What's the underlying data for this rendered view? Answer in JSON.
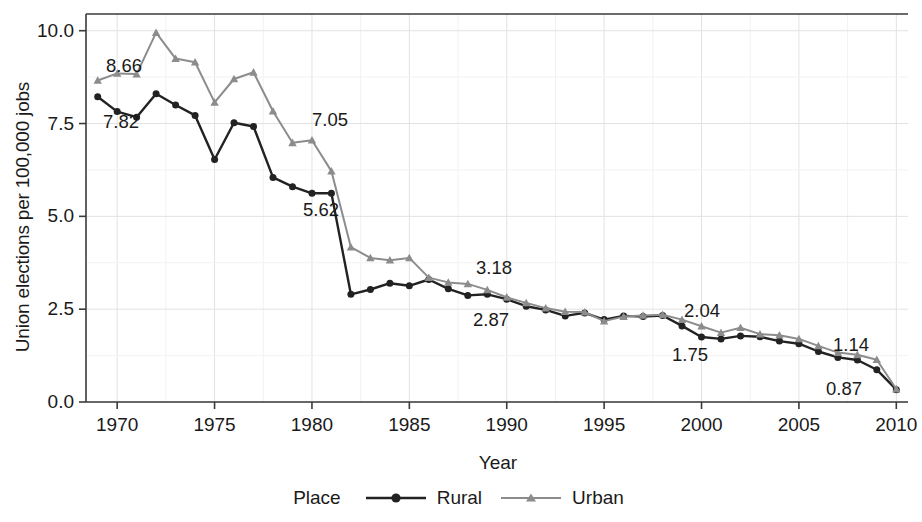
{
  "chart_data": {
    "type": "line",
    "title": "",
    "xlabel": "Year",
    "ylabel": "Union elections per 100,000 jobs",
    "xlim": [
      1968.4,
      2010.6
    ],
    "ylim": [
      0.0,
      10.45
    ],
    "xticks": [
      1970,
      1975,
      1980,
      1985,
      1990,
      1995,
      2000,
      2005,
      2010
    ],
    "yticks": [
      "0.0",
      "2.5",
      "5.0",
      "7.5",
      "10.0"
    ],
    "grid": true,
    "legend_position": "bottom",
    "legend_title": "Place",
    "x": [
      1969,
      1970,
      1971,
      1972,
      1973,
      1974,
      1975,
      1976,
      1977,
      1978,
      1979,
      1980,
      1981,
      1982,
      1983,
      1984,
      1985,
      1986,
      1987,
      1988,
      1989,
      1990,
      1991,
      1992,
      1993,
      1994,
      1995,
      1996,
      1997,
      1998,
      1999,
      2000,
      2001,
      2002,
      2003,
      2004,
      2005,
      2006,
      2007,
      2008,
      2009,
      2010
    ],
    "series": [
      {
        "name": "Rural",
        "color": "#222222",
        "marker": "circle",
        "values": [
          8.22,
          7.82,
          7.67,
          8.3,
          8.0,
          7.72,
          6.53,
          7.52,
          7.42,
          6.05,
          5.8,
          5.62,
          5.62,
          2.9,
          3.03,
          3.2,
          3.13,
          3.3,
          3.05,
          2.87,
          2.9,
          2.77,
          2.58,
          2.48,
          2.32,
          2.4,
          2.22,
          2.32,
          2.3,
          2.33,
          2.05,
          1.75,
          1.7,
          1.78,
          1.76,
          1.64,
          1.57,
          1.36,
          1.2,
          1.13,
          0.87,
          0.33
        ]
      },
      {
        "name": "Urban",
        "color": "#8c8c8c",
        "marker": "triangle",
        "values": [
          8.66,
          8.85,
          8.83,
          9.95,
          9.25,
          9.15,
          8.07,
          8.7,
          8.88,
          7.83,
          6.98,
          7.05,
          6.22,
          4.17,
          3.88,
          3.82,
          3.88,
          3.35,
          3.22,
          3.18,
          3.02,
          2.82,
          2.67,
          2.53,
          2.43,
          2.42,
          2.18,
          2.3,
          2.33,
          2.35,
          2.22,
          2.04,
          1.87,
          2.0,
          1.83,
          1.8,
          1.7,
          1.51,
          1.33,
          1.27,
          1.14,
          0.35
        ]
      }
    ],
    "point_labels": [
      {
        "text": "8.66",
        "series": "Urban",
        "year": 1969,
        "value": 8.66,
        "px": 124,
        "py": 66
      },
      {
        "text": "7.82",
        "series": "Rural",
        "year": 1970,
        "value": 7.82,
        "px": 121,
        "py": 122
      },
      {
        "text": "7.05",
        "series": "Urban",
        "year": 1980,
        "value": 7.05,
        "px": 330,
        "py": 120
      },
      {
        "text": "5.62",
        "series": "Rural",
        "year": 1980,
        "value": 5.62,
        "px": 321,
        "py": 210
      },
      {
        "text": "3.18",
        "series": "Urban",
        "year": 1988,
        "value": 3.18,
        "px": 494,
        "py": 268
      },
      {
        "text": "2.87",
        "series": "Rural",
        "year": 1988,
        "value": 2.87,
        "px": 491,
        "py": 320
      },
      {
        "text": "2.04",
        "series": "Urban",
        "year": 2000,
        "value": 2.04,
        "px": 702,
        "py": 311
      },
      {
        "text": "1.75",
        "series": "Rural",
        "year": 2000,
        "value": 1.75,
        "px": 690,
        "py": 355
      },
      {
        "text": "1.14",
        "series": "Urban",
        "year": 2009,
        "value": 1.14,
        "px": 851,
        "py": 345
      },
      {
        "text": "0.87",
        "series": "Rural",
        "year": 2009,
        "value": 0.87,
        "px": 844,
        "py": 389
      }
    ]
  }
}
